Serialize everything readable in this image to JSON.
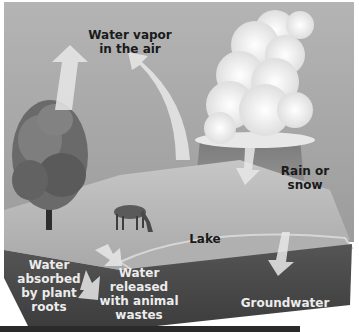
{
  "diagram": {
    "labels": {
      "water_vapor": "Water vapor\nin the air",
      "rain_or_snow": "Rain or\nsnow",
      "lake": "Lake",
      "water_absorbed": "Water\nabsorbed\nby plant\nroots",
      "water_released": "Water\nreleased\nwith animal\nwastes",
      "groundwater": "Groundwater"
    },
    "elements": [
      "sky",
      "cloud",
      "tree",
      "deer",
      "lake",
      "ground-block",
      "arrows"
    ],
    "colors": {
      "sky": "#a9a9a9",
      "cloud": "#f4f4f4",
      "land_surface": "#bdbdbd",
      "soil": "#4a4a4a",
      "arrow": "#e6e6e6",
      "dark_text": "#1a1a1a",
      "light_text": "#ececec"
    }
  }
}
